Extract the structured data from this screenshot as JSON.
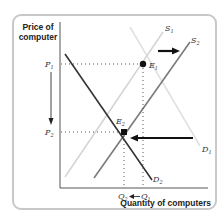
{
  "figure": {
    "y_axis_label": "Price of computer",
    "y_axis_label_line1": "Price of",
    "y_axis_label_line2": "computer",
    "x_axis_label": "Quantity of computers",
    "price_labels": {
      "p1": "P",
      "p1_sub": "1",
      "p2": "P",
      "p2_sub": "2"
    },
    "quantity_labels": {
      "q1": "Q",
      "q1_sub": "1",
      "q2": "Q",
      "q2_sub": "2"
    },
    "curves": [
      {
        "name": "S1",
        "label": "S",
        "sub": "1",
        "type": "supply",
        "shade": "light",
        "color": "#d4d4d4"
      },
      {
        "name": "S2",
        "label": "S",
        "sub": "2",
        "type": "supply",
        "shade": "medium",
        "color": "#7a7a7a"
      },
      {
        "name": "D1",
        "label": "D",
        "sub": "1",
        "type": "demand",
        "shade": "light",
        "color": "#e0e0e0"
      },
      {
        "name": "D2",
        "label": "D",
        "sub": "2",
        "type": "demand",
        "shade": "dark",
        "color": "#333333"
      }
    ],
    "equilibria": [
      {
        "name": "E1",
        "label": "E",
        "sub": "1",
        "price": "P1",
        "quantity": "Q1"
      },
      {
        "name": "E2",
        "label": "E",
        "sub": "2",
        "price": "P2",
        "quantity": "Q2"
      }
    ],
    "arrows": [
      {
        "name": "supply-shift",
        "direction": "right"
      },
      {
        "name": "demand-shift",
        "direction": "left"
      },
      {
        "name": "price-change",
        "direction": "down",
        "from": "P1",
        "to": "P2"
      },
      {
        "name": "quantity-change",
        "direction": "left",
        "from": "Q1",
        "to": "Q2"
      }
    ],
    "colors": {
      "axis": "#555555",
      "border": "#c8c8c8",
      "arrow": "#111111",
      "dotted": "#555555"
    }
  }
}
